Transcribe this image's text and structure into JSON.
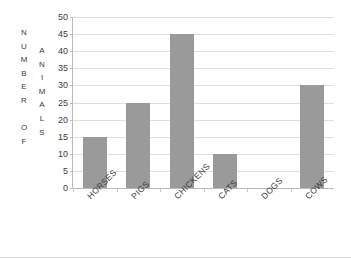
{
  "top_clipped_text": "",
  "axis_titles": {
    "y_primary": "NUMBER OF",
    "y_secondary": "ANIMALS",
    "y_primary_letters": [
      "N",
      "U",
      "M",
      "B",
      "E",
      "R",
      "",
      "O",
      "F"
    ],
    "y_secondary_letters": [
      "A",
      "N",
      "I",
      "M",
      "A",
      "L",
      "S"
    ]
  },
  "colors": {
    "bar_fill": "#9a9a9a",
    "gridline": "#dfdfdf",
    "axis_line": "#b9b9b9",
    "text": "#3b3b3b",
    "background": "#ffffff",
    "image_border": "#d8d8d8"
  },
  "chart_data": {
    "type": "bar",
    "title": "",
    "xlabel": "",
    "ylabel": "NUMBER OF ANIMALS",
    "categories": [
      "HORSES",
      "PIGS",
      "CHICKENS",
      "CATS",
      "DOGS",
      "COWS"
    ],
    "values": [
      15,
      25,
      45,
      10,
      0,
      30
    ],
    "ylim": [
      0,
      50
    ],
    "ytick_step": 5,
    "yticks": [
      0,
      5,
      10,
      15,
      20,
      25,
      30,
      35,
      40,
      45,
      50
    ],
    "ytick_labels": [
      "0",
      "5",
      "10",
      "15",
      "20",
      "25",
      "30",
      "35",
      "40",
      "45",
      "50"
    ],
    "grid": true,
    "grid_axis": "y",
    "legend": false,
    "legend_position": "none",
    "bar_color": "#9a9a9a",
    "category_label_rotation": -45
  }
}
